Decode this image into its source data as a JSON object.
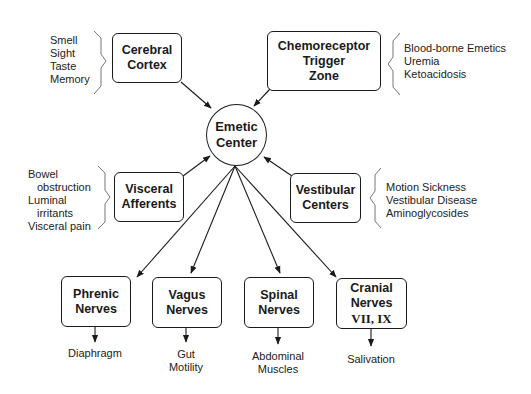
{
  "diagram": {
    "center": {
      "line1": "Emetic",
      "line2": "Center"
    },
    "inputs": {
      "cerebral_cortex": {
        "label": [
          "Cerebral",
          "Cortex"
        ],
        "triggers": [
          "Smell",
          "Sight",
          "Taste",
          "Memory"
        ]
      },
      "ctz": {
        "label": [
          "Chemoreceptor",
          "Trigger",
          "Zone"
        ],
        "triggers": [
          "Blood-borne Emetics",
          "Uremia",
          "Ketoacidosis"
        ]
      },
      "visceral_afferents": {
        "label": [
          "Visceral",
          "Afferents"
        ],
        "triggers": [
          "Bowel",
          "obstruction",
          "Luminal",
          "irritants",
          "Visceral pain"
        ]
      },
      "vestibular_centers": {
        "label": [
          "Vestibular",
          "Centers"
        ],
        "triggers": [
          "Motion Sickness",
          "Vestibular Disease",
          "Aminoglycosides"
        ]
      }
    },
    "outputs": {
      "phrenic": {
        "label": [
          "Phrenic",
          "Nerves"
        ],
        "effect": [
          "Diaphragm"
        ]
      },
      "vagus": {
        "label": [
          "Vagus",
          "Nerves"
        ],
        "effect": [
          "Gut",
          "Motility"
        ]
      },
      "spinal": {
        "label": [
          "Spinal",
          "Nerves"
        ],
        "effect": [
          "Abdominal",
          "Muscles"
        ]
      },
      "cranial": {
        "label": [
          "Cranial",
          "Nerves",
          "VII, IX"
        ],
        "effect": [
          "Salivation"
        ]
      }
    },
    "colors": {
      "stroke": "#1a1a1a",
      "brace": "#777777",
      "background": "#ffffff"
    }
  }
}
